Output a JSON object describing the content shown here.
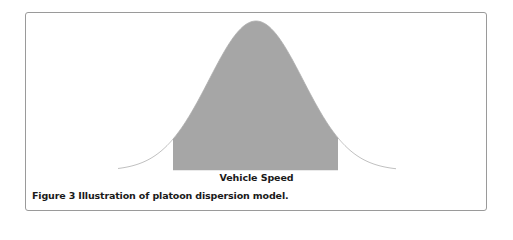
{
  "figure": {
    "caption": "Figure 3 Illustration of platoon dispersion model.",
    "x_axis_label": "Vehicle Speed",
    "fill_color": "#a6a6a6",
    "curve_color": "#9a9a9a",
    "border_color": "#9a9a9a"
  },
  "chart_data": {
    "type": "area",
    "title": "",
    "caption": "Figure 3 Illustration of platoon dispersion model.",
    "xlabel": "Vehicle Speed",
    "ylabel": "",
    "curve": {
      "shape": "bell-shaped, appears Gaussian; distribution not labeled in figure",
      "peak_x_relative": 0.5,
      "tail_range_relative": [
        0.0,
        1.0
      ]
    },
    "shaded_region": {
      "x_start_relative": 0.2,
      "x_end_relative": 0.8,
      "color": "#a6a6a6"
    },
    "axis_ticks": false,
    "grid": false,
    "legend": false
  }
}
